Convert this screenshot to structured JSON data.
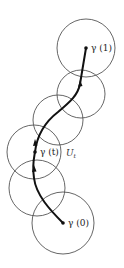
{
  "diagram": {
    "colors": {
      "circle": "#555555",
      "path": "#111111",
      "label": "#222222"
    },
    "circles": [
      {
        "cx": 86,
        "cy": 48,
        "r": 29
      },
      {
        "cx": 81,
        "cy": 94,
        "r": 24
      },
      {
        "cx": 58,
        "cy": 120,
        "r": 25
      },
      {
        "cx": 34,
        "cy": 152,
        "r": 27
      },
      {
        "cx": 37,
        "cy": 188,
        "r": 28
      },
      {
        "cx": 63,
        "cy": 223,
        "r": 31
      }
    ],
    "points": [
      {
        "name": "gamma-1",
        "x": 86,
        "y": 48,
        "label": "γ (1)"
      },
      {
        "name": "gamma-t",
        "x": 35,
        "y": 152,
        "label": "γ (t)"
      },
      {
        "name": "gamma-0",
        "x": 63,
        "y": 223,
        "label": "γ (0)"
      }
    ],
    "neighborhood_label": {
      "text": "U",
      "subscript": "t"
    }
  }
}
